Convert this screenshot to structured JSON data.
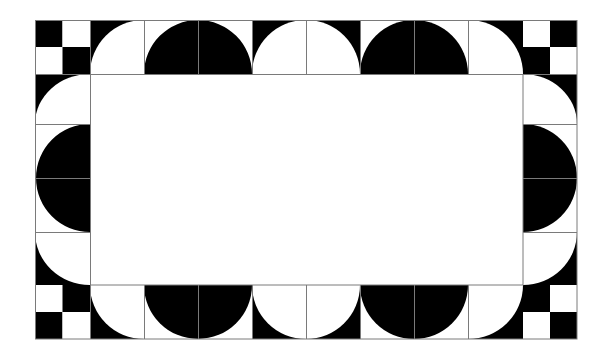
{
  "figure": {
    "title": "Tiled border pattern of checkerboard corners and alternating black and white semicircles",
    "background": "#ffffff",
    "ink": "#000000",
    "line_color": "#7a7a7a",
    "frame": {
      "left": 35,
      "top": 20,
      "right": 577,
      "bottom": 339
    },
    "inner": {
      "left": 90,
      "top": 74,
      "right": 523,
      "bottom": 285
    },
    "columns": [
      35,
      90,
      144,
      198,
      252,
      306,
      360,
      414,
      468,
      523,
      577
    ],
    "rows": [
      20,
      74,
      124,
      178,
      232,
      285,
      339
    ],
    "corners": [
      {
        "name": "top-left",
        "pattern": [
          "black",
          "white",
          "white",
          "black"
        ]
      },
      {
        "name": "top-right",
        "pattern": [
          "white",
          "black",
          "black",
          "white"
        ]
      },
      {
        "name": "bottom-left",
        "pattern": [
          "white",
          "black",
          "black",
          "white"
        ]
      },
      {
        "name": "bottom-right",
        "pattern": [
          "black",
          "white",
          "white",
          "black"
        ]
      }
    ],
    "top_edge": [
      "quarter-white",
      "semicircle-black",
      "semicircle-white",
      "semicircle-black",
      "quarter-white"
    ],
    "bottom_edge": [
      "quarter-white",
      "semicircle-black",
      "semicircle-white",
      "semicircle-black",
      "quarter-white"
    ],
    "left_edge": [
      "quarter-white",
      "semicircle-black",
      "quarter-white"
    ],
    "right_edge": [
      "quarter-white",
      "semicircle-black",
      "quarter-white"
    ]
  }
}
